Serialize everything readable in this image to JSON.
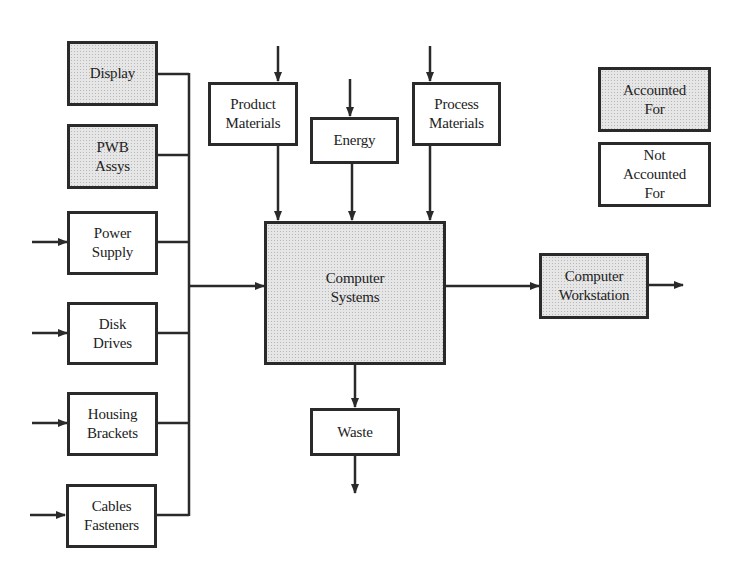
{
  "diagram": {
    "type": "material-flow block diagram",
    "legend": {
      "accounted": {
        "label_line1": "Accounted",
        "label_line2": "For",
        "fill": "shaded"
      },
      "not_accounted": {
        "label_line1": "Not",
        "label_line2": "Accounted",
        "label_line3": "For",
        "fill": "white"
      }
    },
    "components": [
      {
        "id": "display",
        "line1": "Display",
        "line2": "",
        "accounted": true,
        "has_input": false
      },
      {
        "id": "pwb",
        "line1": "PWB",
        "line2": "Assys",
        "accounted": true,
        "has_input": false
      },
      {
        "id": "power",
        "line1": "Power",
        "line2": "Supply",
        "accounted": false,
        "has_input": true
      },
      {
        "id": "disk",
        "line1": "Disk",
        "line2": "Drives",
        "accounted": false,
        "has_input": true
      },
      {
        "id": "housing",
        "line1": "Housing",
        "line2": "Brackets",
        "accounted": false,
        "has_input": true
      },
      {
        "id": "cables",
        "line1": "Cables",
        "line2": "Fasteners",
        "accounted": false,
        "has_input": true
      }
    ],
    "inputs": [
      {
        "id": "product",
        "line1": "Product",
        "line2": "Materials",
        "accounted": false
      },
      {
        "id": "energy",
        "line1": "Energy",
        "line2": "",
        "accounted": false
      },
      {
        "id": "process",
        "line1": "Process",
        "line2": "Materials",
        "accounted": false
      }
    ],
    "central": {
      "line1": "Computer",
      "line2": "Systems",
      "accounted": true
    },
    "output": {
      "line1": "Computer",
      "line2": "Workstation",
      "accounted": true
    },
    "waste": {
      "label": "Waste",
      "accounted": false
    },
    "colors": {
      "line": "#2a2a2a",
      "shade": "#e6e6e6",
      "background": "#ffffff"
    }
  }
}
